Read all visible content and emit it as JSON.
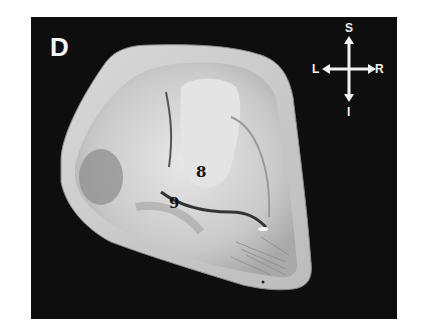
{
  "figure": {
    "panel_letter": "D",
    "background_color": "#0e0e0e",
    "labels": [
      {
        "text": "8",
        "x": 196,
        "y": 165
      },
      {
        "text": "9",
        "x": 169,
        "y": 196
      }
    ],
    "orientation": {
      "superior": "S",
      "inferior": "I",
      "left": "L",
      "right": "R"
    }
  }
}
